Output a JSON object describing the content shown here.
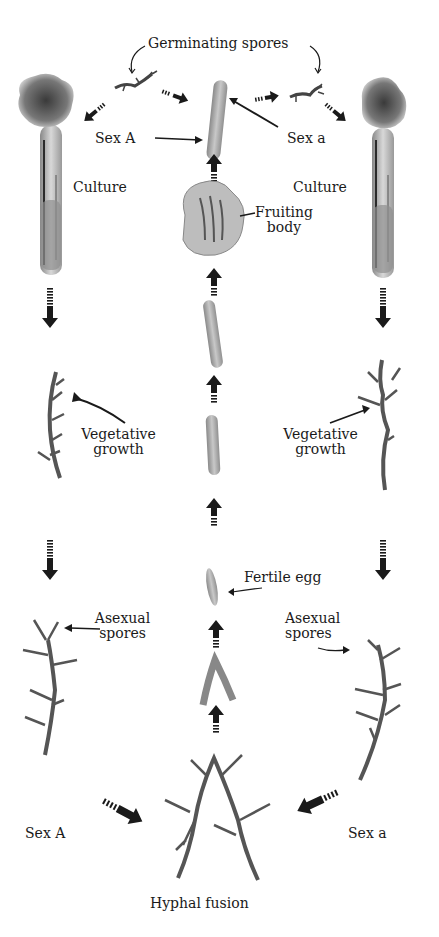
{
  "diagram": {
    "labels": {
      "germinating_spores": "Germinating spores",
      "sex_A_top": "Sex A",
      "sex_a_top": "Sex a",
      "culture_left": "Culture",
      "culture_right": "Culture",
      "fruiting_body_1": "Fruiting",
      "fruiting_body_2": "body",
      "vegetative_left_1": "Vegetative",
      "vegetative_left_2": "growth",
      "vegetative_right_1": "Vegetative",
      "vegetative_right_2": "growth",
      "fertile_egg": "Fertile egg",
      "asexual_left_1": "Asexual",
      "asexual_left_2": "spores",
      "asexual_right_1": "Asexual",
      "asexual_right_2": "spores",
      "sex_A_bottom": "Sex A",
      "sex_a_bottom": "Sex a",
      "hyphal_fusion": "Hyphal fusion"
    },
    "colors": {
      "ink": "#1a1a1a",
      "tube_gray": "#9a9a9a",
      "mold_dark": "#555555",
      "tissue": "#b0b0b0",
      "background": "#ffffff"
    }
  }
}
